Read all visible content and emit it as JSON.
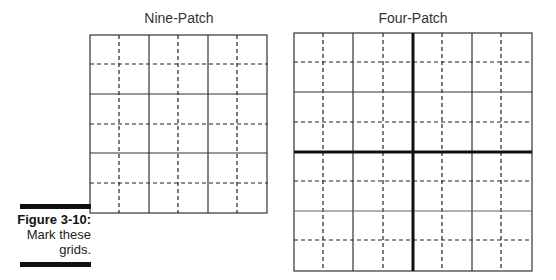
{
  "nine_patch": {
    "title": "Nine-Patch",
    "cols": 3,
    "rows": 3
  },
  "four_patch": {
    "title": "Four-Patch",
    "cols": 4,
    "rows": 4
  },
  "caption": {
    "label": "Figure 3-10:",
    "line1": "Mark these",
    "line2": "grids."
  }
}
